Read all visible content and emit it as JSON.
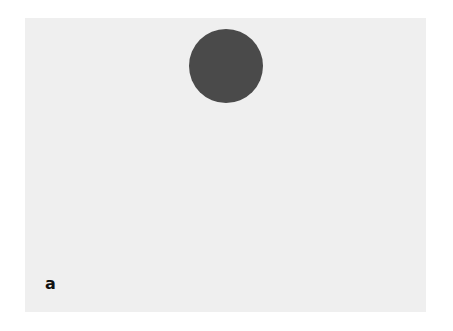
{
  "figure": {
    "panel_label": "a",
    "background_color": "#efefef",
    "circle": {
      "color": "#4a4a4a",
      "center_x": 226,
      "center_y": 66,
      "radius": 37
    }
  }
}
